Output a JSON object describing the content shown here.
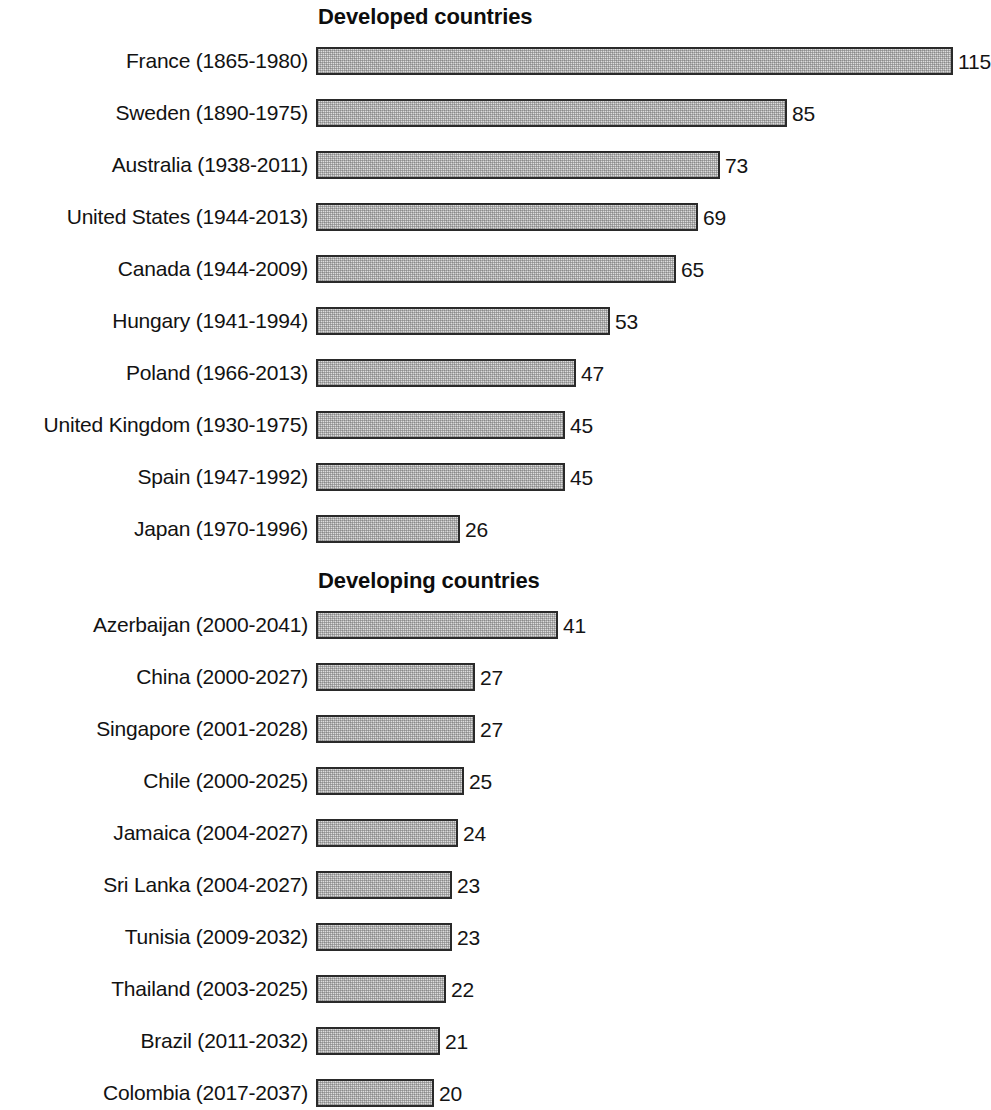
{
  "figure": {
    "background_color": "#ffffff",
    "bar_fill_color": "#dedede",
    "bar_border_color": "#2a2a2a",
    "text_color": "#121212"
  },
  "sections": [
    {
      "title": "Developed countries",
      "rows": [
        {
          "label": "France (1865-1980)",
          "value": 115,
          "value_label": "115"
        },
        {
          "label": "Sweden (1890-1975)",
          "value": 85,
          "value_label": "85"
        },
        {
          "label": "Australia (1938-2011)",
          "value": 73,
          "value_label": "73"
        },
        {
          "label": "United States (1944-2013)",
          "value": 69,
          "value_label": "69"
        },
        {
          "label": "Canada (1944-2009)",
          "value": 65,
          "value_label": "65"
        },
        {
          "label": "Hungary (1941-1994)",
          "value": 53,
          "value_label": "53"
        },
        {
          "label": "Poland (1966-2013)",
          "value": 47,
          "value_label": "47"
        },
        {
          "label": "United Kingdom (1930-1975)",
          "value": 45,
          "value_label": "45"
        },
        {
          "label": "Spain (1947-1992)",
          "value": 45,
          "value_label": "45"
        },
        {
          "label": "Japan (1970-1996)",
          "value": 26,
          "value_label": "26"
        }
      ]
    },
    {
      "title": "Developing countries",
      "rows": [
        {
          "label": "Azerbaijan (2000-2041)",
          "value": 41,
          "value_label": "41"
        },
        {
          "label": "China (2000-2027)",
          "value": 27,
          "value_label": "27"
        },
        {
          "label": "Singapore (2001-2028)",
          "value": 27,
          "value_label": "27"
        },
        {
          "label": "Chile (2000-2025)",
          "value": 25,
          "value_label": "25"
        },
        {
          "label": "Jamaica (2004-2027)",
          "value": 24,
          "value_label": "24"
        },
        {
          "label": "Sri Lanka (2004-2027)",
          "value": 23,
          "value_label": "23"
        },
        {
          "label": "Tunisia (2009-2032)",
          "value": 23,
          "value_label": "23"
        },
        {
          "label": "Thailand (2003-2025)",
          "value": 22,
          "value_label": "22"
        },
        {
          "label": "Brazil (2011-2032)",
          "value": 21,
          "value_label": "21"
        },
        {
          "label": "Colombia (2017-2037)",
          "value": 20,
          "value_label": "20"
        }
      ]
    }
  ],
  "chart_data": {
    "type": "bar",
    "orientation": "horizontal",
    "title": "",
    "xlabel": "",
    "ylabel": "",
    "grid": false,
    "legend": null,
    "data_labels": true,
    "panels": [
      {
        "title": "Developed countries",
        "categories": [
          "France (1865-1980)",
          "Sweden (1890-1975)",
          "Australia (1938-2011)",
          "United States (1944-2013)",
          "Canada (1944-2009)",
          "Hungary (1941-1994)",
          "Poland (1966-2013)",
          "United Kingdom (1930-1975)",
          "Spain (1947-1992)",
          "Japan (1970-1996)"
        ],
        "values": [
          115,
          85,
          73,
          69,
          65,
          53,
          47,
          45,
          45,
          26
        ],
        "xlim": [
          0,
          115
        ],
        "px_per_unit": 5.54
      },
      {
        "title": "Developing countries",
        "categories": [
          "Azerbaijan (2000-2041)",
          "China (2000-2027)",
          "Singapore (2001-2028)",
          "Chile (2000-2025)",
          "Jamaica (2004-2027)",
          "Sri Lanka (2004-2027)",
          "Tunisia (2009-2032)",
          "Thailand (2003-2025)",
          "Brazil (2011-2032)",
          "Colombia (2017-2037)"
        ],
        "values": [
          41,
          27,
          27,
          25,
          24,
          23,
          23,
          22,
          21,
          20
        ],
        "xlim": [
          0,
          41
        ],
        "px_per_unit": 5.9
      }
    ]
  },
  "layout": {
    "bar_origin_x": 316,
    "label_right_x": 308,
    "row_pitch": 52,
    "bar_height": 28,
    "section1_title_y": 4,
    "section1_first_row_y": 44,
    "section2_title_y": 568,
    "section2_first_row_y": 608
  }
}
